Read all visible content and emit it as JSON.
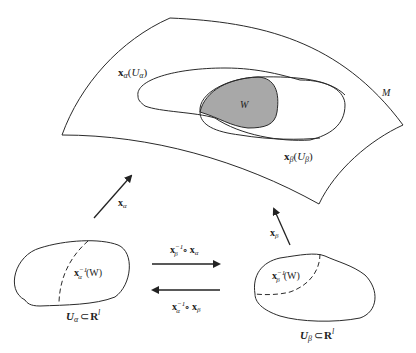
{
  "diagram": {
    "type": "manifold-charts",
    "colors": {
      "stroke": "#2a2a2a",
      "overlap_fill": "#a8a8a8",
      "background": "#ffffff"
    },
    "manifold": {
      "label": "M"
    },
    "regions": {
      "image_alpha": {
        "base": "x",
        "sub": "α",
        "arg_base": "U",
        "arg_sub": "α"
      },
      "image_beta": {
        "base": "x",
        "sub": "β",
        "arg_base": "U",
        "arg_sub": "β"
      },
      "overlap": {
        "label": "W"
      }
    },
    "charts": {
      "alpha": {
        "map": {
          "base": "x",
          "sub": "α"
        },
        "preimage": {
          "base": "x",
          "sub": "α",
          "sup": "−1",
          "arg": "(W)"
        },
        "domain": {
          "base": "U",
          "sub": "α",
          "rel": "⊂",
          "space": "R",
          "sup": "l"
        }
      },
      "beta": {
        "map": {
          "base": "x",
          "sub": "β"
        },
        "preimage": {
          "base": "x",
          "sub": "β",
          "sup": "−1",
          "arg": "(W)"
        },
        "domain": {
          "base": "U",
          "sub": "β",
          "rel": "⊂",
          "space": "R",
          "sup": "l"
        }
      }
    },
    "transitions": {
      "forward": {
        "a_base": "x",
        "a_sub": "β",
        "a_sup": "−1",
        "dot": "∘",
        "b_base": "x",
        "b_sub": "α"
      },
      "backward": {
        "a_base": "x",
        "a_sub": "α",
        "a_sup": "−1",
        "dot": "∘",
        "b_base": "x",
        "b_sub": "β"
      }
    }
  }
}
